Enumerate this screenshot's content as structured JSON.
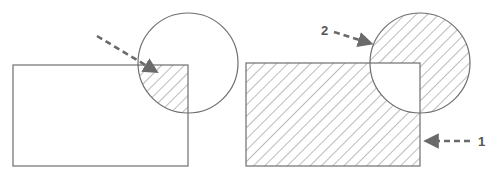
{
  "colors": {
    "stroke": "#6e6e6e",
    "hatch": "#7a7a7a",
    "arrow": "#6a6a6a",
    "background": "#ffffff"
  },
  "panels": [
    {
      "id": "left",
      "description": "Intersection of rectangle and circle (hatched overlap region)",
      "rectangle": {
        "x": 13,
        "y": 65,
        "width": 175,
        "height": 101
      },
      "circle": {
        "cx": 188,
        "cy": 63,
        "r": 50
      },
      "hatched_region": "intersection",
      "arrows": [
        {
          "label": "",
          "from": [
            97,
            36
          ],
          "to": [
            158,
            73
          ]
        }
      ]
    },
    {
      "id": "right",
      "description": "Symmetric difference of rectangle and circle (hatched everywhere except overlap)",
      "rectangle": {
        "x": 246,
        "y": 63,
        "width": 174,
        "height": 103
      },
      "circle": {
        "cx": 420,
        "cy": 63,
        "r": 50
      },
      "hatched_region": "symmetric-difference",
      "arrows": [
        {
          "label": "2",
          "from": [
            334,
            32
          ],
          "to": [
            373,
            45
          ]
        },
        {
          "label": "1",
          "from": [
            470,
            141
          ],
          "to": [
            424,
            141
          ]
        }
      ]
    }
  ],
  "labels": {
    "arrow_1": "1",
    "arrow_2": "2"
  }
}
